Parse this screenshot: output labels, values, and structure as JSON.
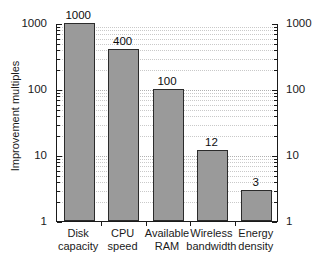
{
  "chart_data": {
    "type": "bar",
    "title": "",
    "xlabel": "",
    "ylabel": "Improvement multiples",
    "yscale": "log",
    "ylim": [
      1,
      1000
    ],
    "grid": true,
    "legend": false,
    "axes": {
      "left_ticks": [
        "1000",
        "100",
        "10",
        "1"
      ],
      "right_ticks": [
        "1000",
        "100",
        "10",
        "1"
      ],
      "mirrored_axis": true,
      "minor_ticks": true
    },
    "categories": [
      "Disk capacity",
      "CPU speed",
      "Available RAM",
      "Wireless bandwidth",
      "Energy density"
    ],
    "category_lines": [
      [
        "Disk",
        "capacity"
      ],
      [
        "CPU",
        "speed"
      ],
      [
        "Available",
        "RAM"
      ],
      [
        "Wireless",
        "bandwidth"
      ],
      [
        "Energy",
        "density"
      ]
    ],
    "values": [
      1000,
      400,
      100,
      12,
      3
    ],
    "data_labels": [
      "1000",
      "400",
      "100",
      "12",
      "3"
    ],
    "colors": {
      "bar_fill": "#9a9a9a",
      "bar_edge": "#2b2b2b",
      "axis": "#1a1a1a",
      "grid": "#c9c9c9",
      "background": "#ffffff"
    }
  }
}
